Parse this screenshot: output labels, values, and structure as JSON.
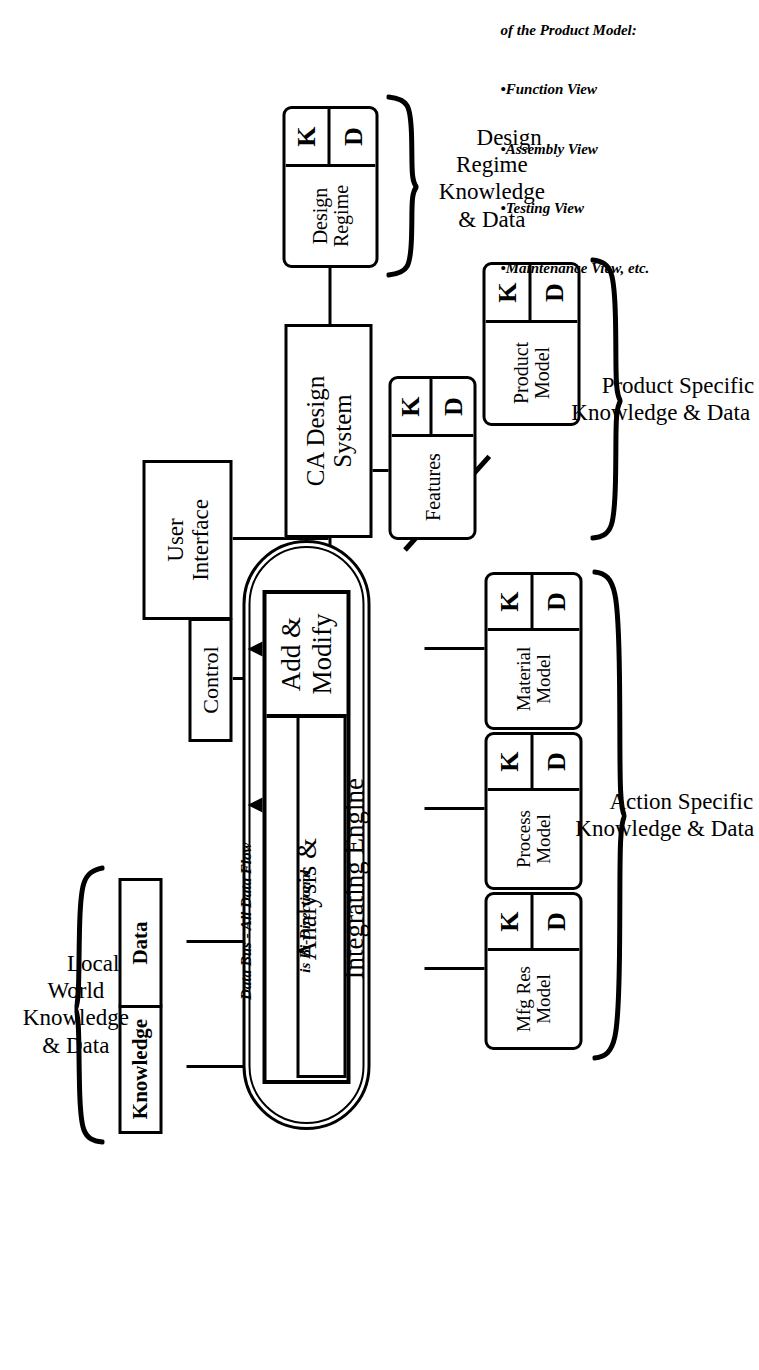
{
  "figure": {
    "domain_note": "Block diagram, rotated 90 degrees on the page"
  },
  "bus_note": {
    "line1": "Data Bus - All Data Flow",
    "line2": "is Bi-Directional"
  },
  "engine": {
    "main_line1": "Analysis &",
    "main_line2": "Integrating Engine",
    "add_modify": "Add & Modify"
  },
  "left_blocks": {
    "control": "Control",
    "user_interface_line1": "User",
    "user_interface_line2": "Interface",
    "ca_design_line1": "CA Design",
    "ca_design_line2": "System"
  },
  "local_world": {
    "knowledge_box": "Knowledge",
    "data_box": "Data",
    "group_label": "Local\nWorld\nKnowledge\n& Data"
  },
  "action_specific": {
    "group_label": "Action Specific\nKnowledge & Data",
    "models": [
      {
        "name_line1": "Material",
        "name_line2": "Model",
        "k": "K",
        "d": "D"
      },
      {
        "name_line1": "Process",
        "name_line2": "Model",
        "k": "K",
        "d": "D"
      },
      {
        "name_line1": "Mfg Res",
        "name_line2": "Model",
        "k": "K",
        "d": "D"
      }
    ]
  },
  "product_specific": {
    "group_label": "Product Specific\nKnowledge & Data",
    "features": {
      "name": "Features",
      "k": "K",
      "d": "D"
    },
    "product_model": {
      "name_line1": "Product",
      "name_line2": "Model",
      "k": "K",
      "d": "D"
    }
  },
  "design_regime": {
    "group_label": "Design\nRegime\nKnowledge\n& Data",
    "block": {
      "name_line1": "Design",
      "name_line2": "Regime",
      "k": "K",
      "d": "D"
    }
  },
  "nb_note": {
    "line1": "NB - There can be several views",
    "line2": "of the Product Model:",
    "bullets": [
      "•Function View",
      "•Assembly View",
      "•Testing View",
      "•Maintenance View, etc."
    ]
  },
  "colors": {
    "ink": "#000000",
    "paper": "#ffffff"
  }
}
